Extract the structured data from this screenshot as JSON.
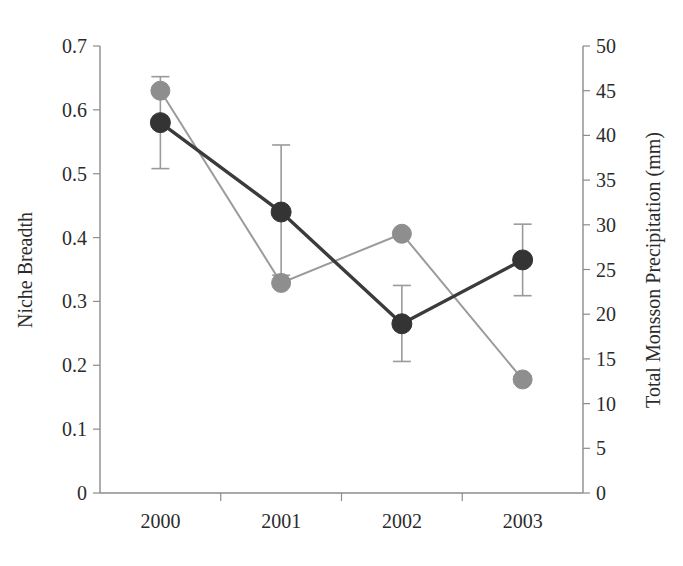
{
  "chart_data": {
    "type": "line",
    "title": "",
    "xlabel": "",
    "categories": [
      "2000",
      "2001",
      "2002",
      "2003"
    ],
    "grid": false,
    "legend": "none",
    "left_axis": {
      "label": "Niche Breadth",
      "ticks": [
        "0",
        "0.1",
        "0.2",
        "0.3",
        "0.4",
        "0.5",
        "0.6",
        "0.7"
      ],
      "tick_values": [
        0,
        0.1,
        0.2,
        0.3,
        0.4,
        0.5,
        0.6,
        0.7
      ],
      "ylim": [
        0,
        0.7
      ]
    },
    "right_axis": {
      "label": "Total Monsson Precipitation (mm)",
      "ticks": [
        "0",
        "5",
        "10",
        "15",
        "20",
        "25",
        "30",
        "35",
        "40",
        "45",
        "50"
      ],
      "tick_values": [
        0,
        5,
        10,
        15,
        20,
        25,
        30,
        35,
        40,
        45,
        50
      ],
      "ylim": [
        0,
        50
      ]
    },
    "series": [
      {
        "name": "Niche Breadth",
        "axis": "left",
        "color": "#343434",
        "marker": "circle",
        "values": [
          0.58,
          0.44,
          0.265,
          0.365
        ],
        "error_low": [
          0.508,
          0.341,
          0.206,
          0.309
        ],
        "error_high": [
          0.652,
          0.545,
          0.325,
          0.421
        ]
      },
      {
        "name": "Total Monsson Precipitation",
        "axis": "right",
        "color": "#8e8e8e",
        "marker": "circle",
        "values": [
          45.0,
          23.5,
          29.0,
          12.7
        ]
      }
    ]
  }
}
